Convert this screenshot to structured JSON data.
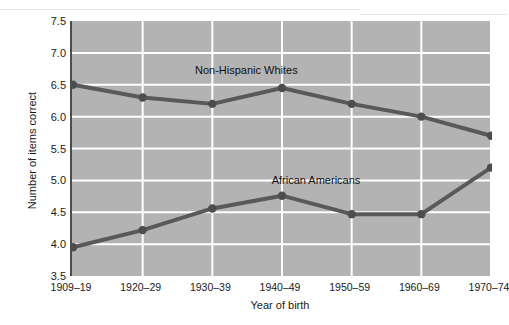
{
  "chart_data": {
    "type": "line",
    "title": "",
    "xlabel": "Year of birth",
    "ylabel": "Number of items correct",
    "categories": [
      "1909–19",
      "1920–29",
      "1930–39",
      "1940–49",
      "1950–59",
      "1960–69",
      "1970–74"
    ],
    "ylim": [
      3.5,
      7.5
    ],
    "ytick_labels": [
      "7.5",
      "7.0",
      "6.5",
      "6.0",
      "5.5",
      "5.0",
      "4.5",
      "4.0",
      "3.5"
    ],
    "ytick_values": [
      7.5,
      7.0,
      6.5,
      6.0,
      5.5,
      5.0,
      4.5,
      4.0,
      3.5
    ],
    "grid": true,
    "legend_position": "inline-annotation",
    "series": [
      {
        "name": "Non-Hispanic Whites",
        "values": [
          6.5,
          6.3,
          6.2,
          6.45,
          6.2,
          6.0,
          5.7
        ],
        "color": "#595959",
        "label_x_category": "1930–39",
        "label_value": 6.7
      },
      {
        "name": "African Americans",
        "values": [
          3.95,
          4.22,
          4.56,
          4.76,
          4.47,
          4.47,
          5.2
        ],
        "color": "#595959",
        "label_x_category": "1940–49",
        "label_value": 4.98
      }
    ],
    "style": {
      "plot_background": "#b3b3b3",
      "gridline_color": "#ffffff",
      "axis_color": "#4d4d4d",
      "line_color": "#595959",
      "marker_color": "#4d4d4d",
      "page_background": "#ffffff"
    }
  }
}
